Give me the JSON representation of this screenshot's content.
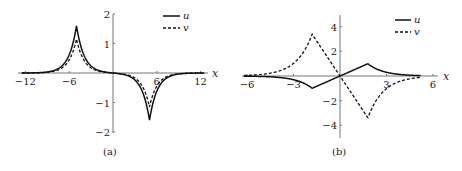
{
  "chart_data": [
    {
      "type": "line",
      "panel": "(a)",
      "caption": "(a)",
      "xlabel": "x",
      "ylabel": "",
      "xlim": [
        -12.5,
        13
      ],
      "ylim": [
        -2,
        2
      ],
      "xticks": [
        -12,
        -6,
        6,
        12
      ],
      "xtick_labels": [
        "−12",
        "−6",
        "6",
        "12"
      ],
      "yticks": [
        2,
        1,
        -1,
        -2
      ],
      "ytick_labels": [
        "2",
        "1",
        "−1",
        "−2"
      ],
      "grid": false,
      "legend": {
        "position": "upper right",
        "entries": [
          "u",
          "v"
        ]
      },
      "series": [
        {
          "name": "u",
          "style": "solid",
          "peak": {
            "x": -5,
            "y": 1.6
          },
          "trough": {
            "x": 5,
            "y": -1.6
          },
          "width": 1.0
        },
        {
          "name": "v",
          "style": "dashed",
          "peak": {
            "x": -5,
            "y": 1.15
          },
          "trough": {
            "x": 5,
            "y": -1.15
          },
          "width": 1.0
        }
      ]
    },
    {
      "type": "line",
      "panel": "(b)",
      "caption": "(b)",
      "xlabel": "x",
      "ylabel": "",
      "xlim": [
        -6,
        6.5
      ],
      "ylim": [
        -5,
        5
      ],
      "xticks": [
        -6,
        -3,
        3,
        6
      ],
      "xtick_labels": [
        "−6",
        "−3",
        "3",
        "6"
      ],
      "yticks": [
        4,
        2,
        -2,
        -4
      ],
      "ytick_labels": [
        "4",
        "2",
        "−2",
        "−4"
      ],
      "grid": false,
      "legend": {
        "position": "upper right",
        "entries": [
          "u",
          "v"
        ]
      },
      "series": [
        {
          "name": "u",
          "style": "solid",
          "peak": {
            "x": 1.8,
            "y": 1.0
          },
          "trough": {
            "x": -1.8,
            "y": -1.0
          }
        },
        {
          "name": "v",
          "style": "dashed",
          "peak": {
            "x": -1.8,
            "y": 3.4
          },
          "trough": {
            "x": 1.8,
            "y": -3.4
          }
        }
      ]
    }
  ]
}
